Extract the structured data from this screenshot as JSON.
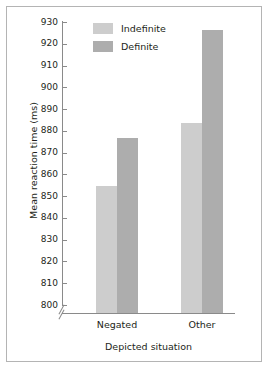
{
  "chart_data": {
    "type": "bar",
    "title": "",
    "xlabel": "Depicted situation",
    "ylabel": "Mean reaction time (ms)",
    "categories": [
      "Negated",
      "Other"
    ],
    "series": [
      {
        "name": "Indefinite",
        "values": [
          854.5,
          883.5
        ],
        "color": "#cdcdcd"
      },
      {
        "name": "Definite",
        "values": [
          876.5,
          926.5
        ],
        "color": "#adadad"
      }
    ],
    "ylim": [
      800,
      930
    ],
    "ytick_step": 10,
    "yticks": [
      930,
      920,
      910,
      900,
      890,
      880,
      870,
      860,
      850,
      840,
      830,
      820,
      810,
      800
    ],
    "ytick_labels": [
      "930",
      "920",
      "910",
      "900",
      "890",
      "880",
      "870",
      "860",
      "850",
      "840",
      "830",
      "820",
      "810",
      "800"
    ],
    "axis_break": true,
    "axis_break_note": "y-axis broken below 800",
    "grid": false,
    "legend_position": "top-left inside plot area",
    "bars_adjacent": true
  },
  "figure": {
    "border_color": "#b4b4b4",
    "axis_color": "#8a8a8a",
    "text_color": "#231f20",
    "background": "#ffffff"
  },
  "legend": {
    "entries": [
      {
        "label": "Indefinite"
      },
      {
        "label": "Definite"
      }
    ]
  }
}
